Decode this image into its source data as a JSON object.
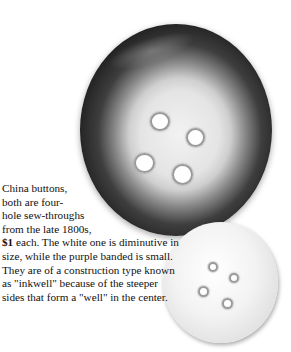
{
  "caption": {
    "line1": "China buttons,",
    "line2": "both are four-",
    "line3": "hole sew-throughs",
    "line4": "from the late 1800s,",
    "price": "$1",
    "rest": " each. The white one is diminutive in size, while the purple banded is small. They are of a construction type known as \"inkwell\" because of the steeper sides that form a \"well\" in the center."
  },
  "images": {
    "large_button": "purple banded china button, four-hole sew-through",
    "small_button": "white china button, four-hole sew-through"
  }
}
